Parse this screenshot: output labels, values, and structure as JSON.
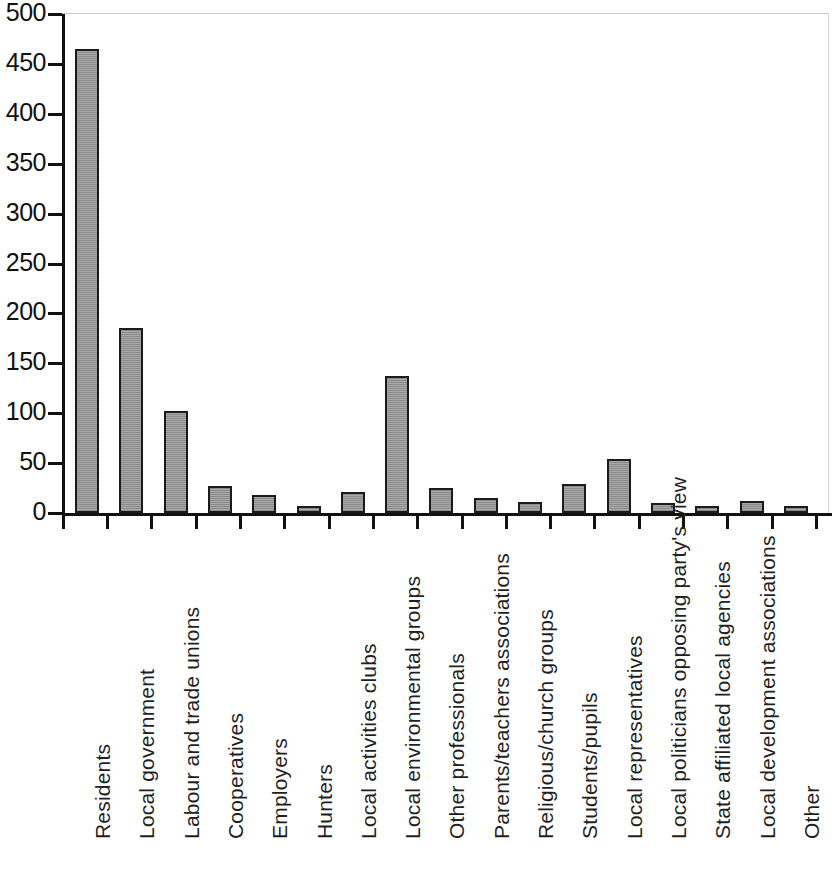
{
  "chart_data": {
    "type": "bar",
    "title": "",
    "subtitle": "",
    "xlabel": "",
    "ylabel": "",
    "ylim": [
      0,
      500
    ],
    "ytick_step": 50,
    "yticks": [
      0,
      50,
      100,
      150,
      200,
      250,
      300,
      350,
      400,
      450,
      500
    ],
    "ytick_labels": [
      "0",
      "50",
      "100",
      "150",
      "200",
      "250",
      "300",
      "350",
      "400",
      "450",
      "500"
    ],
    "grid": false,
    "legend": null,
    "bar_color": "#9a9a9a",
    "bar_edge_color": "#1b1b1b",
    "axis_color": "#111111",
    "categories": [
      "Residents",
      "Local government",
      "Labour and trade unions",
      "Cooperatives",
      "Employers",
      "Hunters",
      "Local activities clubs",
      "Local environmental groups",
      "Other professionals",
      "Parents/teachers associations",
      "Religious/church groups",
      "Students/pupils",
      "Local representatives",
      "Local politicians opposing party's view",
      "State affiliated local agencies",
      "Local development associations",
      "Other"
    ],
    "values": [
      465,
      185,
      102,
      27,
      18,
      7,
      21,
      137,
      25,
      15,
      11,
      29,
      54,
      10,
      7,
      12,
      7
    ]
  }
}
